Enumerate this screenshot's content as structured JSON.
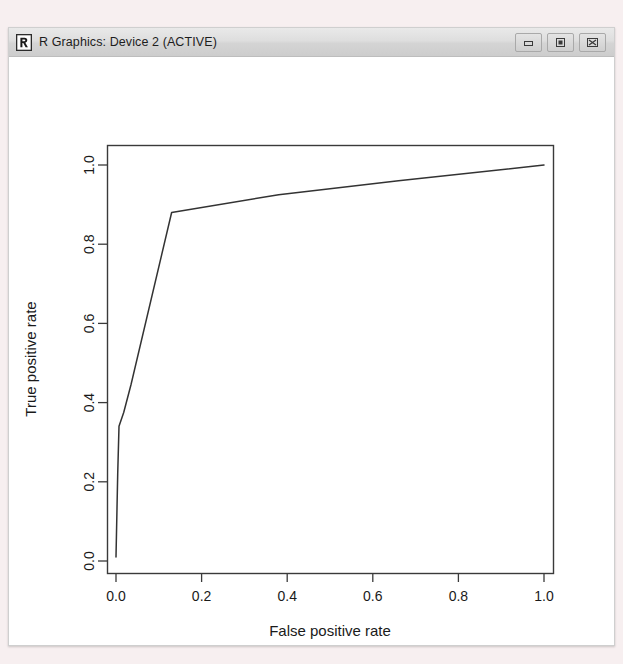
{
  "window": {
    "title": "R Graphics: Device 2 (ACTIVE)",
    "icon": "r-logo-icon",
    "controls": {
      "minimize_label": "Minimize",
      "maximize_label": "Maximize",
      "close_label": "Close"
    }
  },
  "colors": {
    "desktop_background": "#f7eff0",
    "titlebar": "#dedede",
    "plot_background": "#ffffff",
    "axis": "#333333",
    "curve": "#333333",
    "text": "#1a1a1a"
  },
  "chart_data": {
    "type": "line",
    "title": "",
    "subtitle": "",
    "xlabel": "False positive rate",
    "ylabel": "True positive rate",
    "xlim": [
      0.0,
      1.0
    ],
    "ylim": [
      0.0,
      1.0
    ],
    "grid": false,
    "legend": null,
    "xticks": [
      "0.0",
      "0.2",
      "0.4",
      "0.6",
      "0.8",
      "1.0"
    ],
    "xtick_values": [
      0.0,
      0.2,
      0.4,
      0.6,
      0.8,
      1.0
    ],
    "yticks": [
      "0.0",
      "0.2",
      "0.4",
      "0.6",
      "0.8",
      "1.0"
    ],
    "ytick_values": [
      0.0,
      0.2,
      0.4,
      0.6,
      0.8,
      1.0
    ],
    "series": [
      {
        "name": "ROC curve",
        "x": [
          0.0,
          0.004,
          0.007,
          0.018,
          0.035,
          0.13,
          0.38,
          0.66,
          1.0
        ],
        "y": [
          0.01,
          0.22,
          0.34,
          0.375,
          0.445,
          0.88,
          0.925,
          0.96,
          1.0
        ]
      }
    ]
  }
}
